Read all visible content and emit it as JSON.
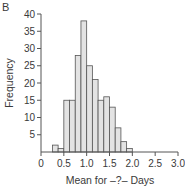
{
  "panel_label": "B",
  "chart_data": {
    "type": "bar",
    "subtype": "histogram",
    "title": "",
    "xlabel": "Mean for –?– Days",
    "ylabel": "Frequency",
    "xlim": [
      0,
      3.0
    ],
    "ylim": [
      0,
      40
    ],
    "x_ticks": [
      "0",
      "0.5",
      "1.0",
      "1.5",
      "2.0",
      "2.5",
      "3.0"
    ],
    "x_tick_values": [
      0,
      0.5,
      1.0,
      1.5,
      2.0,
      2.5,
      3.0
    ],
    "y_ticks": [
      "5",
      "10",
      "15",
      "20",
      "25",
      "30",
      "35",
      "40"
    ],
    "y_tick_values": [
      5,
      10,
      15,
      20,
      25,
      30,
      35,
      40
    ],
    "grid": false,
    "legend": null,
    "bin_width": 0.125,
    "bin_edges": [
      0.25,
      0.375,
      0.5,
      0.625,
      0.75,
      0.875,
      1.0,
      1.125,
      1.25,
      1.375,
      1.5,
      1.625,
      1.75,
      1.875,
      2.0
    ],
    "categories": [
      "0.25-0.375",
      "0.375-0.5",
      "0.5-0.625",
      "0.625-0.75",
      "0.75-0.875",
      "0.875-1.0",
      "1.0-1.125",
      "1.125-1.25",
      "1.25-1.375",
      "1.375-1.5",
      "1.5-1.625",
      "1.625-1.75",
      "1.75-1.875",
      "1.875-2.0"
    ],
    "values": [
      2,
      1,
      15,
      15,
      28,
      38,
      25,
      21,
      15,
      16,
      13,
      7,
      3,
      1
    ],
    "bar_fill": "#e3e3e3",
    "bar_stroke": "#555555"
  }
}
